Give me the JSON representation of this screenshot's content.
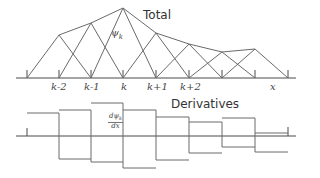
{
  "top": {
    "title": "Total",
    "basis_label": "ψ",
    "basis_sub": "k",
    "x_label": "x",
    "node_labels": [
      "k-2",
      "k-1",
      "k",
      "k+1",
      "k+2"
    ]
  },
  "bottom": {
    "title": "Derivatives",
    "deriv_num": "dψ",
    "deriv_sub": "k",
    "deriv_den": "dx"
  },
  "colors": {
    "line": "#6a6a6a",
    "axis": "#4a4a4a",
    "text": "#333333"
  }
}
